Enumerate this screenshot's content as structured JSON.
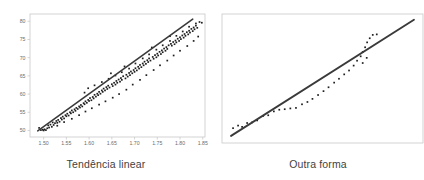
{
  "figure": {
    "panels": [
      {
        "id": "left",
        "caption": "Tendência linear",
        "frame_color": "#c9c9c9",
        "point_color": "#1f1f1f",
        "line_color": "#3a3a3a"
      },
      {
        "id": "right",
        "caption": "Outra forma",
        "frame_color": "#c9c9c9",
        "point_color": "#1f1f1f",
        "line_color": "#3a3a3a"
      }
    ]
  },
  "chart_data": [
    {
      "type": "scatter",
      "title": "Tendência linear",
      "xlabel": "",
      "ylabel": "",
      "grid": false,
      "legend": "none",
      "xlim": [
        1.47,
        1.855
      ],
      "ylim": [
        48.2,
        82.0
      ],
      "xticks": [
        "1.50",
        "1.55",
        "1.60",
        "1.65",
        "1.70",
        "1.75",
        "1.80",
        "1.85"
      ],
      "xtick_values": [
        1.5,
        1.55,
        1.6,
        1.65,
        1.7,
        1.75,
        1.8,
        1.85
      ],
      "yticks": [
        "50",
        "55",
        "60",
        "65",
        "70",
        "75",
        "80"
      ],
      "ytick_values": [
        50,
        55,
        60,
        65,
        70,
        75,
        80
      ],
      "trendline": {
        "x": [
          1.487,
          1.828
        ],
        "y": [
          49.9,
          80.6
        ]
      },
      "points": [
        [
          1.49,
          50.7
        ],
        [
          1.494,
          50.1
        ],
        [
          1.498,
          50.2
        ],
        [
          1.5,
          50.0
        ],
        [
          1.502,
          50.3
        ],
        [
          1.505,
          50.1
        ],
        [
          1.508,
          50.6
        ],
        [
          1.51,
          51.4
        ],
        [
          1.512,
          50.8
        ],
        [
          1.515,
          51.6
        ],
        [
          1.518,
          51.0
        ],
        [
          1.52,
          52.2
        ],
        [
          1.522,
          51.5
        ],
        [
          1.525,
          52.0
        ],
        [
          1.528,
          52.6
        ],
        [
          1.53,
          52.1
        ],
        [
          1.532,
          52.9
        ],
        [
          1.535,
          52.4
        ],
        [
          1.538,
          53.4
        ],
        [
          1.54,
          53.0
        ],
        [
          1.542,
          53.8
        ],
        [
          1.545,
          53.3
        ],
        [
          1.548,
          54.2
        ],
        [
          1.55,
          53.9
        ],
        [
          1.552,
          54.6
        ],
        [
          1.555,
          54.1
        ],
        [
          1.558,
          55.0
        ],
        [
          1.56,
          54.7
        ],
        [
          1.562,
          55.5
        ],
        [
          1.565,
          55.0
        ],
        [
          1.568,
          55.8
        ],
        [
          1.57,
          55.4
        ],
        [
          1.572,
          56.2
        ],
        [
          1.575,
          55.9
        ],
        [
          1.578,
          56.6
        ],
        [
          1.58,
          56.3
        ],
        [
          1.582,
          57.0
        ],
        [
          1.585,
          56.6
        ],
        [
          1.588,
          57.5
        ],
        [
          1.59,
          60.4
        ],
        [
          1.59,
          57.2
        ],
        [
          1.592,
          58.0
        ],
        [
          1.595,
          57.6
        ],
        [
          1.598,
          58.4
        ],
        [
          1.6,
          58.1
        ],
        [
          1.602,
          58.9
        ],
        [
          1.605,
          58.3
        ],
        [
          1.608,
          59.2
        ],
        [
          1.61,
          58.8
        ],
        [
          1.612,
          59.8
        ],
        [
          1.615,
          59.3
        ],
        [
          1.618,
          60.1
        ],
        [
          1.62,
          59.7
        ],
        [
          1.622,
          60.6
        ],
        [
          1.625,
          60.1
        ],
        [
          1.628,
          61.0
        ],
        [
          1.63,
          60.6
        ],
        [
          1.632,
          61.5
        ],
        [
          1.635,
          61.0
        ],
        [
          1.638,
          61.9
        ],
        [
          1.64,
          61.4
        ],
        [
          1.642,
          62.3
        ],
        [
          1.645,
          61.8
        ],
        [
          1.648,
          65.7
        ],
        [
          1.65,
          62.7
        ],
        [
          1.652,
          62.2
        ],
        [
          1.655,
          63.1
        ],
        [
          1.658,
          62.6
        ],
        [
          1.66,
          63.6
        ],
        [
          1.662,
          63.1
        ],
        [
          1.665,
          64.0
        ],
        [
          1.668,
          63.4
        ],
        [
          1.67,
          64.4
        ],
        [
          1.672,
          63.9
        ],
        [
          1.675,
          64.9
        ],
        [
          1.678,
          67.6
        ],
        [
          1.68,
          64.3
        ],
        [
          1.682,
          65.3
        ],
        [
          1.685,
          64.8
        ],
        [
          1.688,
          65.8
        ],
        [
          1.69,
          65.2
        ],
        [
          1.692,
          66.2
        ],
        [
          1.695,
          65.7
        ],
        [
          1.698,
          66.6
        ],
        [
          1.7,
          66.1
        ],
        [
          1.702,
          67.1
        ],
        [
          1.705,
          66.5
        ],
        [
          1.708,
          67.5
        ],
        [
          1.71,
          67.0
        ],
        [
          1.712,
          68.0
        ],
        [
          1.715,
          67.4
        ],
        [
          1.718,
          68.4
        ],
        [
          1.72,
          67.9
        ],
        [
          1.722,
          68.9
        ],
        [
          1.725,
          68.3
        ],
        [
          1.728,
          69.3
        ],
        [
          1.73,
          68.8
        ],
        [
          1.732,
          69.8
        ],
        [
          1.735,
          69.2
        ],
        [
          1.738,
          72.8
        ],
        [
          1.74,
          70.2
        ],
        [
          1.742,
          69.7
        ],
        [
          1.745,
          70.7
        ],
        [
          1.748,
          70.1
        ],
        [
          1.75,
          71.1
        ],
        [
          1.752,
          70.6
        ],
        [
          1.755,
          71.6
        ],
        [
          1.758,
          71.0
        ],
        [
          1.76,
          72.0
        ],
        [
          1.762,
          71.5
        ],
        [
          1.765,
          72.5
        ],
        [
          1.768,
          71.9
        ],
        [
          1.77,
          72.9
        ],
        [
          1.772,
          72.4
        ],
        [
          1.775,
          73.4
        ],
        [
          1.778,
          75.9
        ],
        [
          1.78,
          73.8
        ],
        [
          1.782,
          73.3
        ],
        [
          1.785,
          74.3
        ],
        [
          1.788,
          73.7
        ],
        [
          1.79,
          74.7
        ],
        [
          1.792,
          74.2
        ],
        [
          1.795,
          75.2
        ],
        [
          1.798,
          74.6
        ],
        [
          1.8,
          75.6
        ],
        [
          1.802,
          75.1
        ],
        [
          1.805,
          76.1
        ],
        [
          1.808,
          75.5
        ],
        [
          1.81,
          76.5
        ],
        [
          1.812,
          76.0
        ],
        [
          1.815,
          77.0
        ],
        [
          1.818,
          76.4
        ],
        [
          1.82,
          77.4
        ],
        [
          1.822,
          76.9
        ],
        [
          1.825,
          77.9
        ],
        [
          1.828,
          77.3
        ],
        [
          1.83,
          78.3
        ],
        [
          1.832,
          77.8
        ],
        [
          1.835,
          78.8
        ],
        [
          1.838,
          78.2
        ],
        [
          1.598,
          61.6
        ],
        [
          1.612,
          62.4
        ],
        [
          1.628,
          63.3
        ],
        [
          1.643,
          64.2
        ],
        [
          1.658,
          65.1
        ],
        [
          1.672,
          66.0
        ],
        [
          1.688,
          67.0
        ],
        [
          1.702,
          68.4
        ],
        [
          1.718,
          69.8
        ],
        [
          1.732,
          70.9
        ],
        [
          1.748,
          72.2
        ],
        [
          1.762,
          73.4
        ],
        [
          1.778,
          74.6
        ],
        [
          1.792,
          76.0
        ],
        [
          1.806,
          77.2
        ],
        [
          1.82,
          78.5
        ],
        [
          1.835,
          79.4
        ],
        [
          1.843,
          79.8
        ],
        [
          1.848,
          79.6
        ],
        [
          1.53,
          51.3
        ],
        [
          1.545,
          52.3
        ],
        [
          1.562,
          53.2
        ],
        [
          1.578,
          54.2
        ],
        [
          1.592,
          55.2
        ],
        [
          1.606,
          56.1
        ],
        [
          1.622,
          57.1
        ],
        [
          1.636,
          58.0
        ],
        [
          1.652,
          59.0
        ],
        [
          1.666,
          60.0
        ],
        [
          1.682,
          61.2
        ],
        [
          1.696,
          62.6
        ],
        [
          1.712,
          63.9
        ],
        [
          1.726,
          65.2
        ],
        [
          1.742,
          66.6
        ],
        [
          1.756,
          67.9
        ],
        [
          1.772,
          69.2
        ],
        [
          1.786,
          70.6
        ],
        [
          1.8,
          71.9
        ],
        [
          1.816,
          73.2
        ],
        [
          1.83,
          74.6
        ],
        [
          1.84,
          75.8
        ]
      ]
    },
    {
      "type": "scatter",
      "title": "Outra forma",
      "xlabel": "",
      "ylabel": "",
      "grid": false,
      "legend": "none",
      "xticks": [],
      "yticks": [],
      "xlim": [
        0,
        1
      ],
      "ylim": [
        0,
        1
      ],
      "trendline": {
        "x": [
          0.045,
          0.955
        ],
        "y": [
          0.055,
          0.955
        ]
      },
      "points": [
        [
          0.055,
          0.115
        ],
        [
          0.08,
          0.135
        ],
        [
          0.1,
          0.125
        ],
        [
          0.125,
          0.155
        ],
        [
          0.15,
          0.16
        ],
        [
          0.175,
          0.175
        ],
        [
          0.205,
          0.21
        ],
        [
          0.23,
          0.215
        ],
        [
          0.258,
          0.245
        ],
        [
          0.285,
          0.258
        ],
        [
          0.312,
          0.262
        ],
        [
          0.34,
          0.268
        ],
        [
          0.368,
          0.272
        ],
        [
          0.398,
          0.3
        ],
        [
          0.425,
          0.318
        ],
        [
          0.45,
          0.342
        ],
        [
          0.478,
          0.372
        ],
        [
          0.505,
          0.402
        ],
        [
          0.53,
          0.432
        ],
        [
          0.558,
          0.468
        ],
        [
          0.582,
          0.498
        ],
        [
          0.608,
          0.532
        ],
        [
          0.632,
          0.562
        ],
        [
          0.655,
          0.6
        ],
        [
          0.672,
          0.638
        ],
        [
          0.69,
          0.672
        ],
        [
          0.7,
          0.706
        ],
        [
          0.712,
          0.742
        ],
        [
          0.722,
          0.78
        ],
        [
          0.735,
          0.812
        ],
        [
          0.75,
          0.838
        ],
        [
          0.77,
          0.842
        ],
        [
          0.7,
          0.62
        ],
        [
          0.72,
          0.66
        ]
      ]
    }
  ]
}
